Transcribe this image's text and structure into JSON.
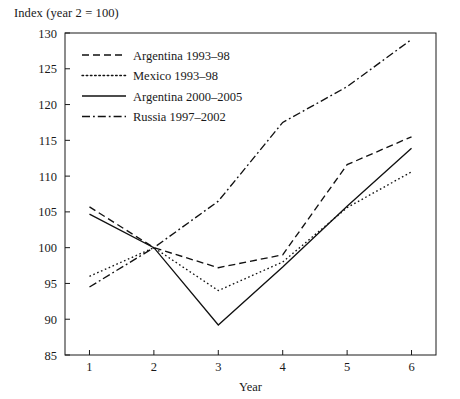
{
  "chart_data": {
    "type": "line",
    "title": "Index (year 2 = 100)",
    "xlabel": "Year",
    "ylabel": "",
    "x": [
      1,
      2,
      3,
      4,
      5,
      6
    ],
    "xticklabels": [
      "1",
      "2",
      "3",
      "4",
      "5",
      "6"
    ],
    "yticklabels": [
      "85",
      "90",
      "95",
      "100",
      "105",
      "110",
      "115",
      "120",
      "125",
      "130"
    ],
    "xlim": [
      0.62,
      6.38
    ],
    "ylim": [
      85,
      130
    ],
    "ytick_step": 5,
    "grid": false,
    "legend_position": "upper-left-inside",
    "series": [
      {
        "name": "Argentina 1993–98",
        "dash": "dashed",
        "values": [
          105.7,
          100.0,
          97.2,
          99.0,
          111.6,
          115.5
        ]
      },
      {
        "name": "Mexico 1993–98",
        "dash": "dotted",
        "values": [
          96.0,
          100.0,
          94.0,
          98.0,
          105.6,
          110.6
        ]
      },
      {
        "name": "Argentina 2000–2005",
        "dash": "solid",
        "values": [
          104.7,
          100.0,
          89.2,
          97.3,
          105.8,
          113.9
        ]
      },
      {
        "name": "Russia 1997–2002",
        "dash": "dashdot",
        "values": [
          94.5,
          100.0,
          106.5,
          117.5,
          122.5,
          129.1
        ]
      }
    ]
  },
  "axis": {
    "x_title": "Year"
  }
}
